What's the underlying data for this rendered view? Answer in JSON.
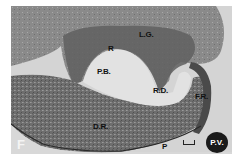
{
  "figure": {
    "panel_letter": "F",
    "labels": {
      "lg": "L.G.",
      "r": "R",
      "pb": "P.B.",
      "rd": "R.D.",
      "fr": "F.R.",
      "dr": "D.R.",
      "p": "P",
      "pv": "P.V."
    },
    "colors": {
      "background": "#d9d9d9",
      "tissue_dark": "#5a5a5a",
      "tissue_mid": "#7a7a7a",
      "lumen": "#e4e4e4"
    }
  }
}
